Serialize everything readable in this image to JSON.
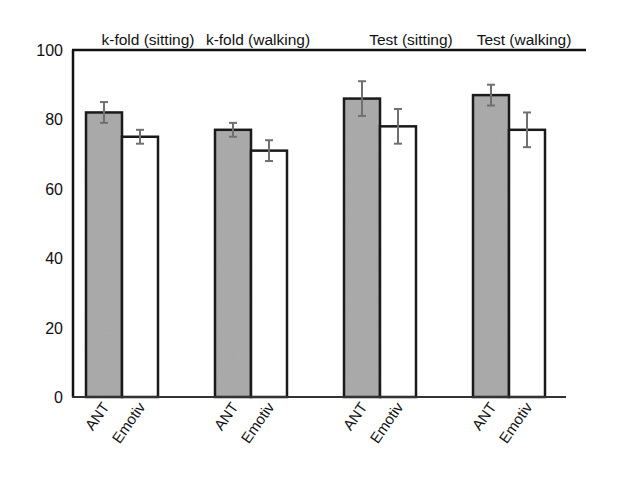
{
  "chart_data": {
    "type": "bar",
    "title": "",
    "group_titles": [
      "k-fold (sitting)",
      "k-fold (walking)",
      "Test (sitting)",
      "Test (walking)"
    ],
    "categories": [
      "k-fold (sitting)",
      "k-fold (walking)",
      "Test (sitting)",
      "Test (walking)"
    ],
    "bar_labels": [
      "ANT",
      "Emotiv"
    ],
    "series": [
      {
        "name": "ANT",
        "color": "#a8a8a8",
        "values": [
          82,
          77,
          86,
          87
        ],
        "error": [
          3,
          2,
          5,
          3
        ]
      },
      {
        "name": "Emotiv",
        "color": "#ffffff",
        "values": [
          75,
          71,
          78,
          77
        ],
        "error": [
          2,
          3,
          5,
          5
        ]
      }
    ],
    "xlabel": "",
    "ylabel": "",
    "ylim": [
      0,
      100
    ],
    "yticks": [
      0,
      20,
      40,
      60,
      80,
      100
    ],
    "grid": false,
    "legend": "none (bar labels rotated under each bar)"
  },
  "axis": {
    "ytick_labels": [
      "0",
      "20",
      "40",
      "60",
      "80",
      "100"
    ]
  }
}
